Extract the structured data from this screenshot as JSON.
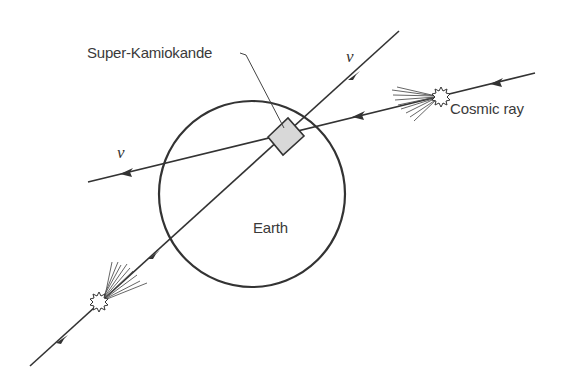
{
  "diagram": {
    "labels": {
      "detector": "Super-Kamiokande",
      "cosmic_ray": "Cosmic ray",
      "earth": "Earth",
      "neutrino_up": "ν",
      "neutrino_left": "ν"
    },
    "elements": {
      "earth_circle": {
        "cx": 252,
        "cy": 194,
        "r": 93
      },
      "detector_box": {
        "center": [
          285,
          137
        ],
        "shape": "rotated-rectangle"
      },
      "cosmic_ray_showers": 2
    },
    "colors": {
      "line": "#333333",
      "detector_fill": "#d8d8d8",
      "text": "#3a3a3a",
      "background": "#ffffff"
    }
  }
}
